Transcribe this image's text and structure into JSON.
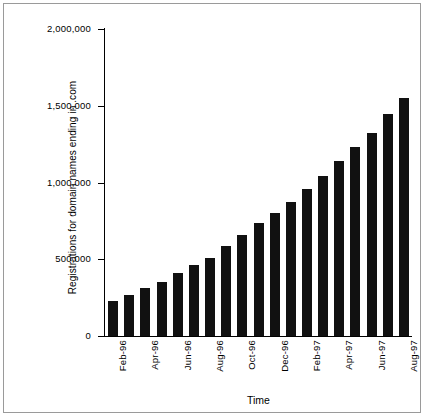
{
  "chart_data": {
    "type": "bar",
    "title": "",
    "xlabel": "Time",
    "ylabel": "Registrations for domain names ending in .com",
    "ylim": [
      0,
      2000000
    ],
    "ytick_labels": [
      "2,000,000",
      "1,500,000",
      "1,000,000",
      "500,000",
      "0"
    ],
    "ytick_values": [
      2000000,
      1500000,
      1000000,
      500000,
      0
    ],
    "grid": false,
    "legend": false,
    "categories": [
      "Feb-96",
      "Mar-96",
      "Apr-96",
      "May-96",
      "Jun-96",
      "Jul-96",
      "Aug-96",
      "Sep-96",
      "Oct-96",
      "Nov-96",
      "Dec-96",
      "Jan-97",
      "Feb-97",
      "Mar-97",
      "Apr-97",
      "May-97",
      "Jun-97",
      "Jul-97",
      "Aug-97"
    ],
    "visible_tick_labels": [
      "Feb-96",
      "Apr-96",
      "Jun-96",
      "Aug-96",
      "Oct-96",
      "Dec-96",
      "Feb-97",
      "Apr-97",
      "Jun-97",
      "Aug-97"
    ],
    "visible_tick_indices": [
      0,
      2,
      4,
      6,
      8,
      10,
      12,
      14,
      16,
      18
    ],
    "values": [
      225000,
      270000,
      310000,
      355000,
      410000,
      460000,
      510000,
      585000,
      660000,
      735000,
      800000,
      875000,
      960000,
      1045000,
      1140000,
      1230000,
      1320000,
      1445000,
      1550000
    ],
    "bar_color": "#111111",
    "axis_color": "#000000",
    "background": "#ffffff",
    "border_color": "#9a9a9a"
  }
}
